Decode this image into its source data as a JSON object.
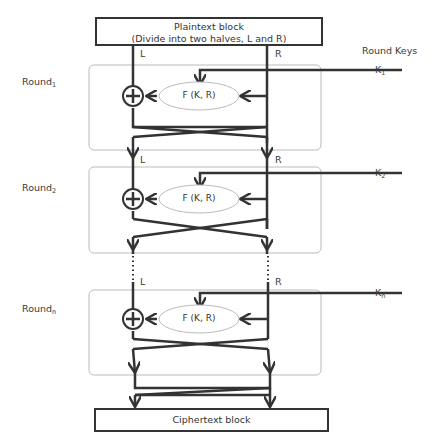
{
  "diagram": {
    "plaintext": {
      "line1": "Plaintext block",
      "line2": "(Divide into two halves, L and R)"
    },
    "ciphertext": "Ciphertext block",
    "round_keys_label": "Round Keys",
    "half_labels": {
      "left": "L",
      "right": "R"
    },
    "function_label": "F (K, R)",
    "rounds": [
      {
        "name": "Round",
        "sub": "1",
        "key": "K",
        "key_sub": "1"
      },
      {
        "name": "Round",
        "sub": "2",
        "key": "K",
        "key_sub": "2"
      },
      {
        "name": "Round",
        "sub": "n",
        "key": "K",
        "key_sub": "n"
      }
    ],
    "colors": {
      "stroke": "#333333",
      "round_box": "#bbbbbb",
      "ellipse": "#bbbbbb"
    }
  }
}
